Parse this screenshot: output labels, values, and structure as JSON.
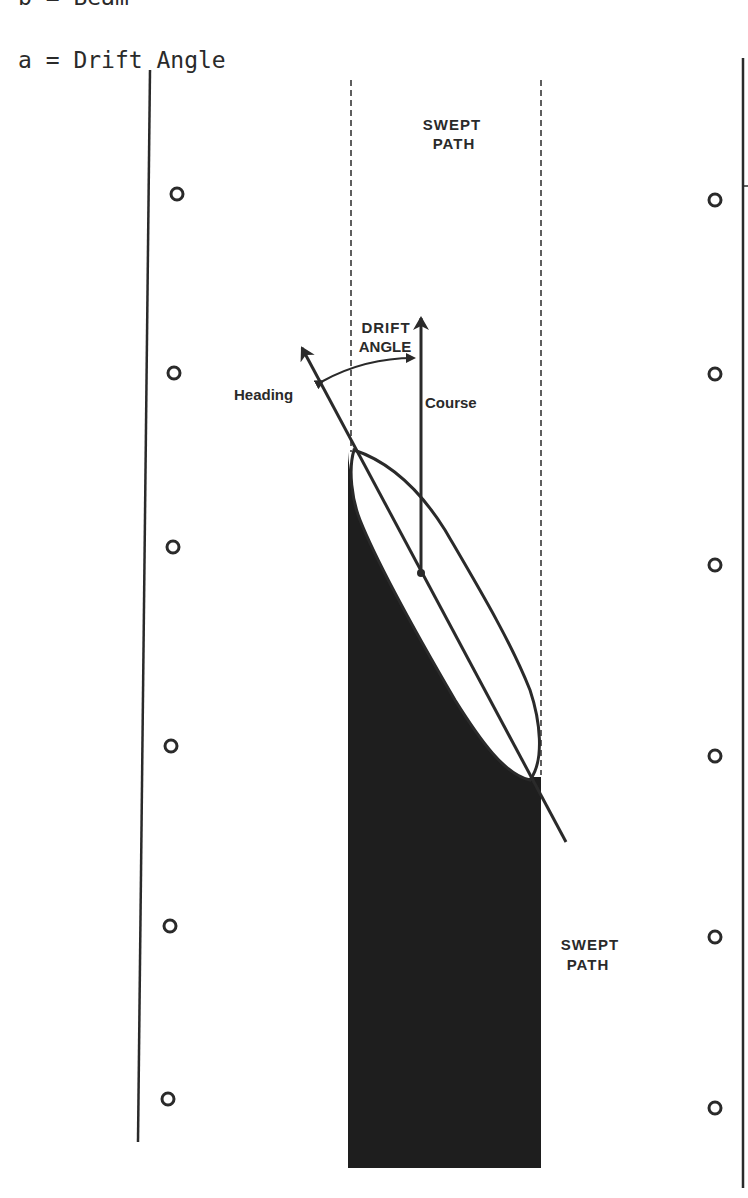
{
  "legend": {
    "b": "b = Beam",
    "a": "a = Drift Angle"
  },
  "labels": {
    "swept_path_top_1": "SWEPT",
    "swept_path_top_2": "PATH",
    "swept_path_bottom_1": "SWEPT",
    "swept_path_bottom_2": "PATH",
    "drift_angle_1": "DRIFT",
    "drift_angle_2": "ANGLE",
    "heading": "Heading",
    "course": "Course"
  },
  "colors": {
    "ink": "#2a2a2a",
    "fill": "#1e1e1e",
    "background": "#ffffff"
  }
}
